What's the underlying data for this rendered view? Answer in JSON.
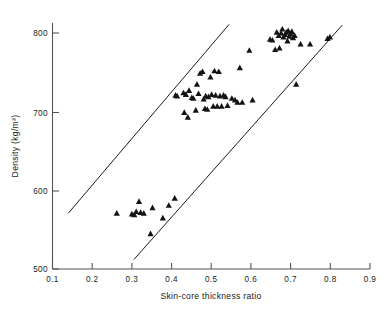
{
  "chart_data": {
    "type": "scatter",
    "title": "",
    "xlabel": "Skin-core thickness ratio",
    "ylabel": "Density (kg/m³)",
    "xlim": [
      0.1,
      0.9
    ],
    "ylim": [
      500,
      810
    ],
    "xticks": [
      0.1,
      0.2,
      0.3,
      0.4,
      0.5,
      0.6,
      0.7,
      0.8,
      0.9
    ],
    "xtick_labels": [
      "0.1",
      "0.2",
      "0.3",
      "0.4",
      "0.5",
      "0.6",
      "0.7",
      "0.8",
      "0.9"
    ],
    "yticks": [
      500,
      600,
      700,
      800
    ],
    "ytick_labels": [
      "500",
      "600",
      "700",
      "800"
    ],
    "grid": false,
    "legend": null,
    "marker": "triangle-filled",
    "marker_color": "#141414",
    "series": [
      {
        "name": "samples",
        "points": [
          [
            0.262,
            571
          ],
          [
            0.3,
            570
          ],
          [
            0.306,
            569
          ],
          [
            0.311,
            573
          ],
          [
            0.318,
            586
          ],
          [
            0.322,
            572
          ],
          [
            0.33,
            571
          ],
          [
            0.347,
            545
          ],
          [
            0.352,
            578
          ],
          [
            0.378,
            565
          ],
          [
            0.393,
            581
          ],
          [
            0.408,
            590
          ],
          [
            0.41,
            721
          ],
          [
            0.414,
            720
          ],
          [
            0.43,
            724
          ],
          [
            0.432,
            699
          ],
          [
            0.436,
            722
          ],
          [
            0.441,
            693
          ],
          [
            0.444,
            727
          ],
          [
            0.451,
            718
          ],
          [
            0.455,
            717
          ],
          [
            0.461,
            702
          ],
          [
            0.464,
            735
          ],
          [
            0.468,
            723
          ],
          [
            0.472,
            749
          ],
          [
            0.478,
            751
          ],
          [
            0.481,
            716
          ],
          [
            0.484,
            704
          ],
          [
            0.486,
            720
          ],
          [
            0.49,
            703
          ],
          [
            0.493,
            719
          ],
          [
            0.498,
            744
          ],
          [
            0.501,
            722
          ],
          [
            0.505,
            707
          ],
          [
            0.508,
            752
          ],
          [
            0.511,
            721
          ],
          [
            0.515,
            707
          ],
          [
            0.519,
            751
          ],
          [
            0.522,
            720
          ],
          [
            0.526,
            707
          ],
          [
            0.531,
            721
          ],
          [
            0.536,
            719
          ],
          [
            0.541,
            708
          ],
          [
            0.552,
            717
          ],
          [
            0.56,
            715
          ],
          [
            0.566,
            712
          ],
          [
            0.572,
            756
          ],
          [
            0.578,
            712
          ],
          [
            0.596,
            778
          ],
          [
            0.604,
            715
          ],
          [
            0.648,
            792
          ],
          [
            0.654,
            791
          ],
          [
            0.661,
            779
          ],
          [
            0.665,
            801
          ],
          [
            0.67,
            797
          ],
          [
            0.672,
            781
          ],
          [
            0.676,
            800
          ],
          [
            0.679,
            805
          ],
          [
            0.682,
            795
          ],
          [
            0.686,
            798
          ],
          [
            0.689,
            801
          ],
          [
            0.692,
            790
          ],
          [
            0.694,
            803
          ],
          [
            0.697,
            796
          ],
          [
            0.7,
            799
          ],
          [
            0.703,
            802
          ],
          [
            0.706,
            794
          ],
          [
            0.71,
            797
          ],
          [
            0.714,
            735
          ],
          [
            0.725,
            786
          ],
          [
            0.749,
            786
          ],
          [
            0.793,
            793
          ],
          [
            0.799,
            795
          ]
        ]
      }
    ],
    "bound_lines": [
      {
        "name": "upper-bound-line",
        "x": [
          0.14,
          0.545
        ],
        "y": [
          571,
          811
        ]
      },
      {
        "name": "lower-bound-line",
        "x": [
          0.305,
          0.83
        ],
        "y": [
          512,
          810
        ]
      }
    ]
  }
}
